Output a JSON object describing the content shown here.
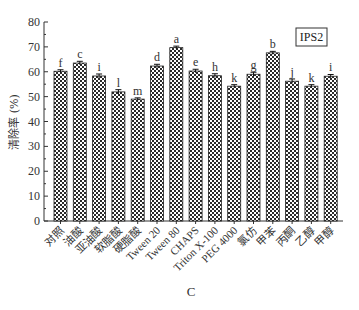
{
  "chart_data": {
    "type": "bar",
    "title": "",
    "xlabel": "C",
    "ylabel": "清除率 (%)",
    "ylim": [
      0,
      80
    ],
    "yticks": [
      0,
      10,
      20,
      30,
      40,
      50,
      60,
      70,
      80
    ],
    "grid": false,
    "legend": {
      "text": "IPS2",
      "placement": "top-right"
    },
    "categories": [
      "对照",
      "油酸",
      "亚油酸",
      "软脂酸",
      "硬脂酸",
      "Tween 20",
      "Tween 80",
      "CHAPS",
      "Triton X-100",
      "PEG 4000",
      "氯仿",
      "甲苯",
      "丙酮",
      "乙醇",
      "甲醇"
    ],
    "values": [
      60.2,
      63.5,
      58.3,
      51.9,
      49.0,
      62.3,
      69.7,
      60.3,
      58.4,
      54.2,
      59.0,
      67.6,
      56.2,
      54.2,
      58.2
    ],
    "errors": [
      0.6,
      0.7,
      0.8,
      0.9,
      0.5,
      0.7,
      0.6,
      0.7,
      0.8,
      0.6,
      0.8,
      0.6,
      0.9,
      0.6,
      0.7
    ],
    "significance": [
      "f",
      "c",
      "i",
      "l",
      "m",
      "d",
      "a",
      "e",
      "h",
      "k",
      "g",
      "b",
      "j",
      "k",
      "i"
    ],
    "bar_pattern": "crosshatch",
    "colors": {
      "bar_fill": "#ffffff",
      "pattern": "#222222",
      "axis": "#333333"
    }
  }
}
